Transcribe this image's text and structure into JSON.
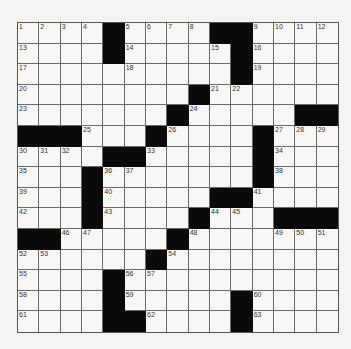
{
  "puzzle": {
    "rows": 15,
    "cols": 15,
    "colors": {
      "block": "#0a0a0a",
      "cell": "#f7f7f5",
      "line": "#6a6a6a"
    },
    "grid": [
      [
        "1",
        "2",
        "3",
        "4",
        "#",
        "5",
        "6",
        "7",
        "8",
        "#",
        "#",
        "9",
        "10",
        "11",
        "12"
      ],
      [
        "13",
        ".",
        ".",
        ".",
        "#",
        "14",
        ".",
        ".",
        ".",
        "15",
        "#",
        "16",
        ".",
        ".",
        "."
      ],
      [
        "17",
        ".",
        ".",
        ".",
        ".",
        "18",
        ".",
        ".",
        ".",
        ".",
        "#",
        "19",
        ".",
        ".",
        "."
      ],
      [
        "20",
        ".",
        ".",
        ".",
        ".",
        ".",
        ".",
        ".",
        "#",
        "21",
        "22",
        ".",
        ".",
        ".",
        "."
      ],
      [
        "23",
        ".",
        ".",
        ".",
        ".",
        ".",
        ".",
        "#",
        "24",
        ".",
        ".",
        ".",
        ".",
        "#",
        "#"
      ],
      [
        "#",
        "#",
        "#",
        "25",
        ".",
        ".",
        "#",
        "26",
        ".",
        ".",
        ".",
        "#",
        "27",
        "28",
        "29"
      ],
      [
        "30",
        "31",
        "32",
        ".",
        "#",
        "#",
        "33",
        ".",
        ".",
        ".",
        ".",
        "#",
        "34",
        ".",
        "."
      ],
      [
        "35",
        ".",
        ".",
        "#",
        "36",
        "37",
        ".",
        ".",
        ".",
        ".",
        ".",
        "#",
        "38",
        ".",
        "."
      ],
      [
        "39",
        ".",
        ".",
        "#",
        "40",
        ".",
        ".",
        ".",
        ".",
        "#",
        "#",
        "41",
        ".",
        ".",
        "."
      ],
      [
        "42",
        ".",
        ".",
        "#",
        "43",
        ".",
        ".",
        ".",
        "#",
        "44",
        "45",
        ".",
        "#",
        "#",
        "#"
      ],
      [
        "#",
        "#",
        "46",
        "47",
        ".",
        ".",
        ".",
        "#",
        "48",
        ".",
        ".",
        ".",
        "49",
        "50",
        "51"
      ],
      [
        "52",
        "53",
        ".",
        ".",
        ".",
        ".",
        "#",
        "54",
        ".",
        ".",
        ".",
        ".",
        ".",
        ".",
        "."
      ],
      [
        "55",
        ".",
        ".",
        ".",
        "#",
        "56",
        "57",
        ".",
        ".",
        ".",
        ".",
        ".",
        ".",
        ".",
        "."
      ],
      [
        "58",
        ".",
        ".",
        ".",
        "#",
        "59",
        ".",
        ".",
        ".",
        ".",
        "#",
        "60",
        ".",
        ".",
        "."
      ],
      [
        "61",
        ".",
        ".",
        ".",
        "#",
        "#",
        "62",
        ".",
        ".",
        ".",
        "#",
        "63",
        ".",
        ".",
        "."
      ]
    ]
  }
}
